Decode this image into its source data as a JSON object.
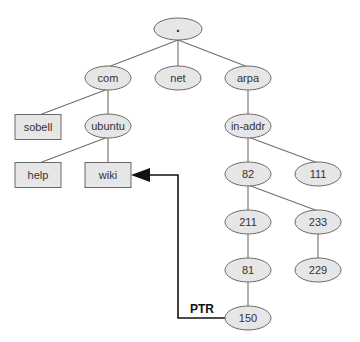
{
  "diagram": {
    "type": "dns-tree",
    "colors": {
      "node_fill": "#e6e6e6",
      "node_stroke": "#6a6a6a",
      "edge": "#6e6e6e",
      "arrow": "#111111",
      "text": "#333333"
    },
    "nodes": [
      {
        "id": "root",
        "label": ".",
        "shape": "ellipse",
        "cx": 178,
        "cy": 29
      },
      {
        "id": "com",
        "label": "com",
        "shape": "ellipse",
        "cx": 108,
        "cy": 78
      },
      {
        "id": "net",
        "label": "net",
        "shape": "ellipse",
        "cx": 178,
        "cy": 78
      },
      {
        "id": "arpa",
        "label": "arpa",
        "shape": "ellipse",
        "cx": 248,
        "cy": 78
      },
      {
        "id": "sobell",
        "label": "sobell",
        "shape": "box",
        "cx": 38,
        "cy": 127
      },
      {
        "id": "ubuntu",
        "label": "ubuntu",
        "shape": "ellipse",
        "cx": 108,
        "cy": 126
      },
      {
        "id": "inaddr",
        "label": "in-addr",
        "shape": "ellipse",
        "cx": 248,
        "cy": 126
      },
      {
        "id": "help",
        "label": "help",
        "shape": "box",
        "cx": 38,
        "cy": 175
      },
      {
        "id": "wiki",
        "label": "wiki",
        "shape": "box",
        "cx": 108,
        "cy": 175
      },
      {
        "id": "n82",
        "label": "82",
        "shape": "ellipse",
        "cx": 248,
        "cy": 174
      },
      {
        "id": "n111",
        "label": "111",
        "shape": "ellipse",
        "cx": 318,
        "cy": 174
      },
      {
        "id": "n211",
        "label": "211",
        "shape": "ellipse",
        "cx": 248,
        "cy": 222
      },
      {
        "id": "n233",
        "label": "233",
        "shape": "ellipse",
        "cx": 318,
        "cy": 222
      },
      {
        "id": "n81",
        "label": "81",
        "shape": "ellipse",
        "cx": 248,
        "cy": 270
      },
      {
        "id": "n229",
        "label": "229",
        "shape": "ellipse",
        "cx": 318,
        "cy": 270
      },
      {
        "id": "n150",
        "label": "150",
        "shape": "ellipse",
        "cx": 248,
        "cy": 318
      }
    ],
    "edges": [
      [
        "root",
        "com"
      ],
      [
        "root",
        "net"
      ],
      [
        "root",
        "arpa"
      ],
      [
        "com",
        "sobell"
      ],
      [
        "com",
        "ubuntu"
      ],
      [
        "ubuntu",
        "help"
      ],
      [
        "ubuntu",
        "wiki"
      ],
      [
        "arpa",
        "inaddr"
      ],
      [
        "inaddr",
        "n82"
      ],
      [
        "inaddr",
        "n111"
      ],
      [
        "n82",
        "n211"
      ],
      [
        "n82",
        "n233"
      ],
      [
        "n211",
        "n81"
      ],
      [
        "n233",
        "n229"
      ],
      [
        "n81",
        "n150"
      ]
    ],
    "pointer": {
      "label": "PTR",
      "from": "n150",
      "to": "wiki"
    }
  }
}
